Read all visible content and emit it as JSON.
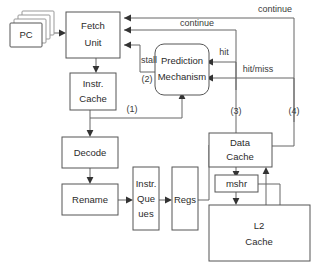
{
  "diagram": {
    "background_color": "#ffffff",
    "box_stroke_color": "#555555",
    "edge_color": "#666666",
    "text_color": "#2b2b2b",
    "nodes": [
      {
        "id": "pc",
        "label": "PC",
        "shape": "stacked-rect"
      },
      {
        "id": "fetch",
        "label_line1": "Fetch",
        "label_line2": "Unit",
        "shape": "rect"
      },
      {
        "id": "icache",
        "label_line1": "Instr.",
        "label_line2": "Cache",
        "shape": "rect"
      },
      {
        "id": "predict",
        "label_line1": "Prediction",
        "label_line2": "Mechanism",
        "shape": "rounded-rect"
      },
      {
        "id": "decode",
        "label": "Decode",
        "shape": "rect"
      },
      {
        "id": "rename",
        "label": "Rename",
        "shape": "rect"
      },
      {
        "id": "iqueues",
        "label_line1": "Instr.",
        "label_line2": "Que",
        "label_line3": "ues",
        "shape": "rect"
      },
      {
        "id": "regs",
        "label": "Regs",
        "shape": "rect"
      },
      {
        "id": "dcache",
        "label_line1": "Data",
        "label_line2": "Cache",
        "shape": "rect"
      },
      {
        "id": "mshr",
        "label": "mshr",
        "shape": "rect"
      },
      {
        "id": "l2cache",
        "label_line1": "L2",
        "label_line2": "Cache",
        "shape": "rect"
      }
    ],
    "edge_labels": [
      {
        "id": "continue-top",
        "text": "continue"
      },
      {
        "id": "continue-inner",
        "text": "continue"
      },
      {
        "id": "stall",
        "text": "stall"
      },
      {
        "id": "hit",
        "text": "hit"
      },
      {
        "id": "hit-miss",
        "text": "hit/miss"
      },
      {
        "id": "marker-1",
        "text": "(1)"
      },
      {
        "id": "marker-2",
        "text": "(2)"
      },
      {
        "id": "marker-3",
        "text": "(3)"
      },
      {
        "id": "marker-4",
        "text": "(4)"
      }
    ]
  }
}
